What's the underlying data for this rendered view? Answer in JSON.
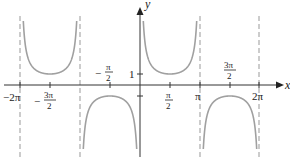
{
  "chart_data": {
    "type": "line",
    "title": "",
    "function": "y = csc(x)",
    "xlabel": "x",
    "ylabel": "y",
    "xlim": [
      -6.4,
      6.9
    ],
    "ylim": [
      -6.3,
      6.3
    ],
    "grid": false,
    "x_tick_labels": [
      "−2π",
      "−3π/2",
      "−π/2",
      "π/2",
      "π",
      "3π/2",
      "2π"
    ],
    "x_ticks": [
      -6.2832,
      -4.7124,
      -1.5708,
      1.5708,
      3.1416,
      4.7124,
      6.2832
    ],
    "y_tick_labels": [
      "1"
    ],
    "y_ticks": [
      1
    ],
    "asymptotes": [
      -6.2832,
      -3.1416,
      0,
      3.1416,
      6.2832
    ],
    "local_extrema": [
      {
        "x": -4.7124,
        "y": 1
      },
      {
        "x": -1.5708,
        "y": -1
      },
      {
        "x": 1.5708,
        "y": 1
      },
      {
        "x": 4.7124,
        "y": -1
      }
    ],
    "colors": {
      "curve": "#a0a0a0",
      "axis": "#333333",
      "asymptote": "#999999"
    }
  },
  "labels": {
    "x_axis": "x",
    "y_axis": "y",
    "neg_2pi": "−2π",
    "neg_3pi2_num": "3π",
    "neg_3pi2_den": "2",
    "neg_pi2_num": "π",
    "neg_pi2_den": "2",
    "pi2_num": "π",
    "pi2_den": "2",
    "pi": "π",
    "pi32_num": "3π",
    "pi32_den": "2",
    "two_pi": "2π",
    "one": "1",
    "minus": "−"
  }
}
